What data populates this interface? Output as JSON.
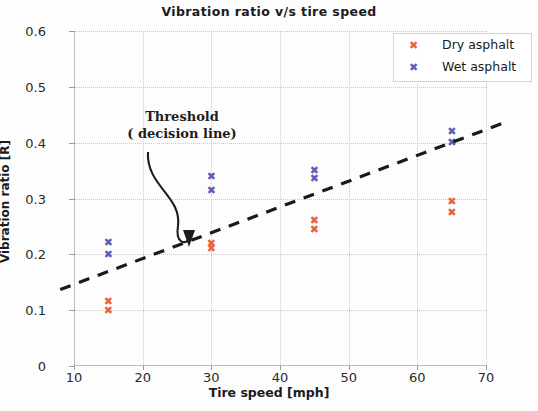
{
  "chart_data": {
    "type": "scatter",
    "title": "Vibration  ratio v/s  tire speed",
    "xlabel": "Tire speed [mph]",
    "ylabel": "Vibration ratio [R]",
    "xlim": [
      10,
      70
    ],
    "ylim": [
      0,
      0.6
    ],
    "xticks": [
      "10",
      "20",
      "30",
      "40",
      "50",
      "60",
      "70"
    ],
    "xtick_values": [
      10,
      20,
      30,
      40,
      50,
      60,
      70
    ],
    "yticks": [
      "0",
      "0.1",
      "0.2",
      "0.3",
      "0.4",
      "0.5",
      "0.6"
    ],
    "ytick_values": [
      0,
      0.1,
      0.2,
      0.3,
      0.4,
      0.5,
      0.6
    ],
    "grid": true,
    "legend_position": "top-right",
    "marker": "x",
    "series": [
      {
        "name": "Dry asphalt",
        "color": "#e8643c",
        "points": [
          {
            "x": 15,
            "y": 0.115
          },
          {
            "x": 15,
            "y": 0.1
          },
          {
            "x": 30,
            "y": 0.22
          },
          {
            "x": 30,
            "y": 0.21
          },
          {
            "x": 45,
            "y": 0.26
          },
          {
            "x": 45,
            "y": 0.245
          },
          {
            "x": 65,
            "y": 0.295
          },
          {
            "x": 65,
            "y": 0.275
          }
        ]
      },
      {
        "name": "Wet asphalt",
        "color": "#5e5eb8",
        "points": [
          {
            "x": 15,
            "y": 0.222
          },
          {
            "x": 15,
            "y": 0.2
          },
          {
            "x": 30,
            "y": 0.34
          },
          {
            "x": 30,
            "y": 0.315
          },
          {
            "x": 45,
            "y": 0.35
          },
          {
            "x": 45,
            "y": 0.335
          },
          {
            "x": 65,
            "y": 0.42
          },
          {
            "x": 65,
            "y": 0.4
          }
        ]
      }
    ],
    "threshold_line": {
      "label": "Threshold ( decision line)",
      "style": "dashed",
      "color": "#1a1a1a",
      "x_start": 8.0,
      "y_start": 0.137,
      "x_end": 72.5,
      "y_end": 0.435
    },
    "annotation": {
      "line1": "Threshold",
      "line2": "( decision line)",
      "target_x": 27,
      "target_y": 0.212
    }
  },
  "colors": {
    "dry": "#e8643c",
    "wet": "#5e5eb8",
    "axis": "#bdbdbd",
    "grid": "#c9c9c9",
    "text": "#1b1b1b",
    "threshold": "#1a1a1a"
  },
  "legend": {
    "items": [
      {
        "label": "Dry asphalt",
        "marker": "x-marker-icon"
      },
      {
        "label": "Wet asphalt",
        "marker": "x-marker-icon"
      }
    ]
  }
}
